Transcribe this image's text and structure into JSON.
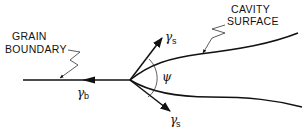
{
  "diagram": {
    "labels": {
      "grain_boundary_line1": "GRAIN",
      "grain_boundary_line2": "BOUNDARY",
      "cavity_surface_line1": "CAVITY",
      "cavity_surface_line2": "SURFACE"
    },
    "symbols": {
      "gamma_b": "γ",
      "gamma_b_sub": "b",
      "gamma_s_upper": "γ",
      "gamma_s_upper_sub": "s",
      "gamma_s_lower": "γ",
      "gamma_s_lower_sub": "s",
      "psi": "ψ"
    },
    "colors": {
      "ink": "#111111",
      "background": "#ffffff"
    }
  }
}
